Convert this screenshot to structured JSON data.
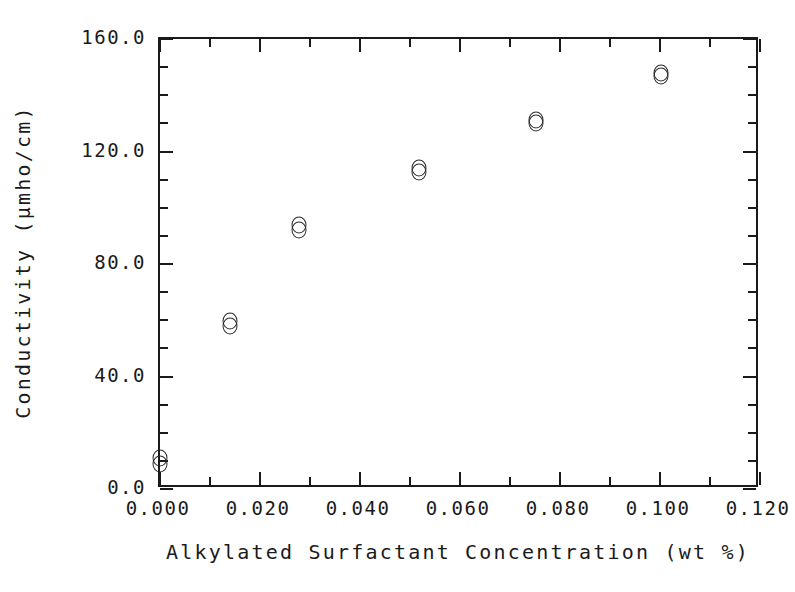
{
  "chart_data": {
    "type": "scatter",
    "title": "",
    "xlabel": "Alkylated Surfactant Concentration (wt %)",
    "ylabel": "Conductivity (μmho/cm)",
    "xlim": [
      0.0,
      0.12
    ],
    "ylim": [
      0.0,
      160.0
    ],
    "xticks": [
      0.0,
      0.02,
      0.04,
      0.06,
      0.08,
      0.1,
      0.12
    ],
    "xticklabels": [
      "0.000",
      "0.020",
      "0.040",
      "0.060",
      "0.080",
      "0.100",
      "0.120"
    ],
    "xminorticks": [
      0.01,
      0.03,
      0.05,
      0.07,
      0.09,
      0.11
    ],
    "yticks": [
      0.0,
      40.0,
      80.0,
      120.0,
      160.0
    ],
    "yticklabels": [
      "0.0",
      "40.0",
      "80.0",
      "120.0",
      "160.0"
    ],
    "yminorticks": [
      10.0,
      20.0,
      30.0,
      50.0,
      60.0,
      70.0,
      90.0,
      100.0,
      110.0,
      130.0,
      140.0,
      150.0
    ],
    "grid": false,
    "legend": null,
    "marker": "open-circle",
    "series": [
      {
        "name": "Run 1",
        "x": [
          0.0,
          0.0139,
          0.0278,
          0.0518,
          0.0752,
          0.1001
        ],
        "y": [
          11.2,
          59.8,
          93.8,
          114.2,
          131.2,
          148.0
        ]
      },
      {
        "name": "Run 2",
        "x": [
          0.0,
          0.0139,
          0.0278,
          0.0518,
          0.0752,
          0.1001
        ],
        "y": [
          9.0,
          58.1,
          92.2,
          112.7,
          130.0,
          147.0
        ]
      }
    ],
    "points": [
      {
        "x": 0.0,
        "y": 11.2
      },
      {
        "x": 0.0,
        "y": 9.0
      },
      {
        "x": 0.0139,
        "y": 59.8
      },
      {
        "x": 0.0139,
        "y": 58.1
      },
      {
        "x": 0.0278,
        "y": 93.8
      },
      {
        "x": 0.0278,
        "y": 92.2
      },
      {
        "x": 0.0518,
        "y": 114.2
      },
      {
        "x": 0.0518,
        "y": 112.7
      },
      {
        "x": 0.0752,
        "y": 131.2
      },
      {
        "x": 0.0752,
        "y": 130.0
      },
      {
        "x": 0.1001,
        "y": 148.0
      },
      {
        "x": 0.1001,
        "y": 147.0
      }
    ],
    "colors": {
      "axis": "#1a1a1a",
      "marker": "#2a2a2a",
      "background": "#ffffff"
    }
  }
}
